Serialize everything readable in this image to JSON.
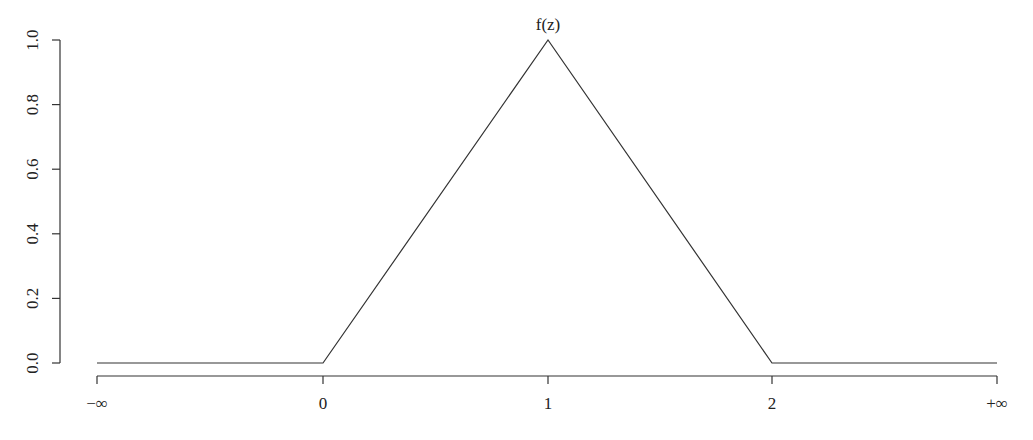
{
  "chart_data": {
    "type": "line",
    "title": "f(z)",
    "xlabel": "",
    "ylabel": "",
    "x_tick_labels": [
      "−∞",
      "0",
      "1",
      "2",
      "+∞"
    ],
    "y_tick_labels": [
      "0.0",
      "0.2",
      "0.4",
      "0.6",
      "0.8",
      "1.0"
    ],
    "ylim": [
      0,
      1
    ],
    "grid": false,
    "legend": null,
    "series": [
      {
        "name": "f(z)",
        "x": [
          "-inf",
          0,
          1,
          2,
          "+inf"
        ],
        "y": [
          0,
          0,
          1,
          0,
          0
        ]
      }
    ]
  },
  "layout": {
    "x_pixel": {
      "-inf": 97,
      "0": 323,
      "1": 548,
      "2": 772,
      "+inf": 997
    },
    "y_pixel": {
      "0.0": 363,
      "1.0": 40
    },
    "y_axis_x": 60,
    "x_axis_y": 376,
    "line_color": "#333333"
  }
}
